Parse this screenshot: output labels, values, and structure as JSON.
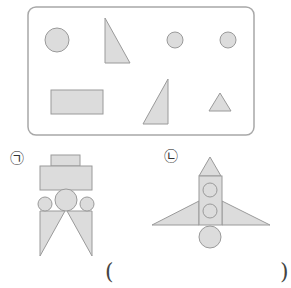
{
  "colors": {
    "fill": "#dcdcdc",
    "stroke": "#9a9a9a",
    "box_stroke": "#a8a8a8"
  },
  "shape_box": {
    "shapes": [
      {
        "type": "circle",
        "size": "large"
      },
      {
        "type": "right-triangle"
      },
      {
        "type": "circle",
        "size": "small"
      },
      {
        "type": "circle",
        "size": "small"
      },
      {
        "type": "rectangle"
      },
      {
        "type": "right-triangle"
      },
      {
        "type": "triangle",
        "size": "small"
      }
    ]
  },
  "figures": [
    {
      "label": "㉠",
      "name": "robot"
    },
    {
      "label": "㉡",
      "name": "rocket"
    }
  ],
  "answer": {
    "open": "(",
    "close": ")",
    "value": ""
  }
}
